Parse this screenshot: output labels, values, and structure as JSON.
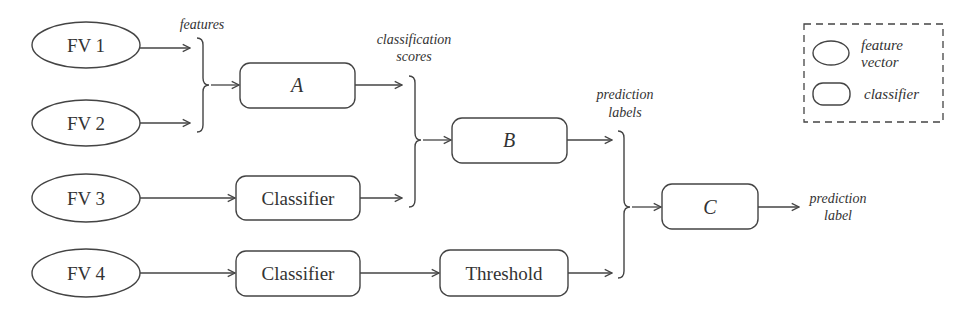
{
  "diagram": {
    "feature_vectors": [
      {
        "id": "fv1",
        "label": "FV 1"
      },
      {
        "id": "fv2",
        "label": "FV 2"
      },
      {
        "id": "fv3",
        "label": "FV 3"
      },
      {
        "id": "fv4",
        "label": "FV 4"
      }
    ],
    "classifiers": {
      "a": {
        "label": "A"
      },
      "b": {
        "label": "B"
      },
      "c": {
        "label": "C"
      },
      "classifier_fv3": {
        "label": "Classifier"
      },
      "classifier_fv4": {
        "label": "Classifier"
      },
      "threshold": {
        "label": "Threshold"
      }
    },
    "annotations": {
      "features": "features",
      "classification_line1": "classification",
      "classification_line2": "scores",
      "prediction_labels_line1": "prediction",
      "prediction_labels_line2": "labels",
      "prediction_label_line1": "prediction",
      "prediction_label_line2": "label"
    },
    "legend": {
      "feature_vector_line1": "feature",
      "feature_vector_line2": "vector",
      "classifier": "classifier"
    },
    "colors": {
      "stroke": "#444444",
      "text": "#333333",
      "background": "#ffffff"
    }
  }
}
